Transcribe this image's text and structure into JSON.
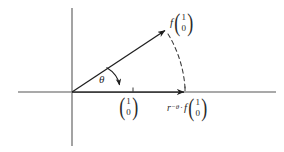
{
  "figure": {
    "name": "rotation-diagram",
    "colors": {
      "axis": "#8c8c8c",
      "vector": "#1e1e1e",
      "dashed": "#3a3a3a",
      "text": "#2a2a2a",
      "background": "#ffffff"
    },
    "labels": {
      "angle": "θ",
      "f_symbol": "f",
      "r_symbol": "r",
      "r_subscript": "−θ",
      "dot_operator": "·",
      "vector_top": "1",
      "vector_bottom": "0"
    },
    "annotations": {
      "image_vector": "f (1 0)",
      "unit_vector": "(1 0)",
      "rotated_vector": "r_{-θ} · f (1 0)"
    }
  },
  "geometry": {
    "origin": {
      "x": 72,
      "y": 92
    },
    "x_axis": {
      "x1": 18,
      "y1": 92,
      "x2": 276,
      "y2": 92
    },
    "y_axis": {
      "x1": 72,
      "y1": 8,
      "x2": 72,
      "y2": 146
    },
    "vector_arrow": {
      "x1": 72,
      "y1": 92,
      "x2": 167,
      "y2": 29
    },
    "x_arrow": {
      "x1": 72,
      "y1": 92,
      "x2": 186,
      "y2": 92
    },
    "ticks": [
      133,
      185
    ],
    "angle_degrees": 33
  }
}
